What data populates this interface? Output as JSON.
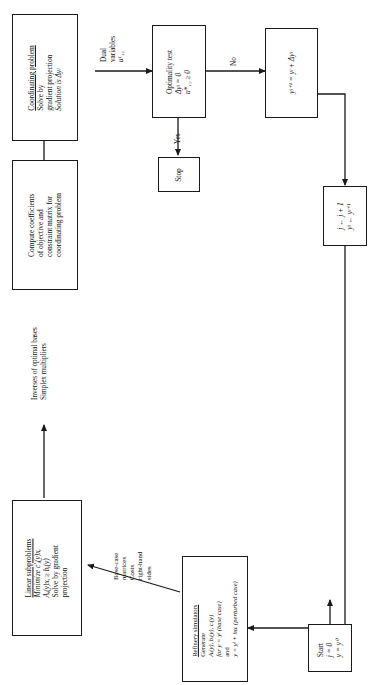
{
  "diagram": {
    "type": "flowchart"
  },
  "nodes": {
    "coordinating": {
      "name": "coordinating-problem-box",
      "lines": [
        "Coordinating problem",
        "Solve by",
        "gradient projection",
        "Solution is Δyʲ"
      ],
      "underline_first": true
    },
    "optimality": {
      "name": "optimality-test-box",
      "lines": [
        "Optimality test",
        "Δyʲ = 0",
        "u*₁₂ ≥ 0"
      ],
      "underline_first": false
    },
    "stop": {
      "name": "stop-box",
      "lines": [
        "Stop"
      ]
    },
    "update_y": {
      "name": "update-y-box",
      "lines": [
        "yʲ⁺¹ = yʲ + Δyʲ"
      ]
    },
    "counter": {
      "name": "iteration-counter-box",
      "lines": [
        "j ← j + 1",
        "yʲ ← yʲ⁺¹"
      ]
    },
    "compute": {
      "name": "compute-coefficients-box",
      "lines": [
        "Compute coefficients",
        "of objective and",
        "constraint matrix for",
        "coordinating problem"
      ]
    },
    "subproblems": {
      "name": "linear-subproblems-box",
      "lines": [
        "Linear subproblems",
        "Minimize c′ᵢ(y)xᵢ",
        "Aᵢ(y)xᵢ ≥ bᵢ(y)",
        "Solve by gradient",
        "projection"
      ],
      "underline_first": true
    },
    "simulators": {
      "name": "refinery-simulators-box",
      "lines": [
        "Refinery simulators",
        "Generate",
        "Aᵢ(y), bᵢ(y), cᵢ(y)",
        "for y = yʲ (base case)",
        "and",
        "y = yʲ + hαᵢ (perturbed case)"
      ],
      "underline_first": true
    },
    "start": {
      "name": "start-box",
      "lines": [
        "Start",
        "j = 0",
        "y = y⁰"
      ]
    }
  },
  "edge_labels": {
    "dual_variables": {
      "name": "dual-variables-label",
      "lines": [
        "Dual",
        "variables",
        "u¹₁₂"
      ]
    },
    "no": {
      "name": "no-label",
      "lines": [
        "No"
      ]
    },
    "yes": {
      "name": "yes-label",
      "lines": [
        "Yes"
      ]
    },
    "inverses": {
      "name": "inverses-label",
      "lines": [
        "Inverses of optimal bases",
        "Simplex multipliers"
      ]
    },
    "base_case": {
      "name": "base-case-label",
      "lines": [
        "Base-case",
        "matrices",
        "Costs",
        "right-hand",
        "sides"
      ]
    }
  },
  "colors": {
    "stroke": "#1a1a1a",
    "background": "#ffffff"
  }
}
